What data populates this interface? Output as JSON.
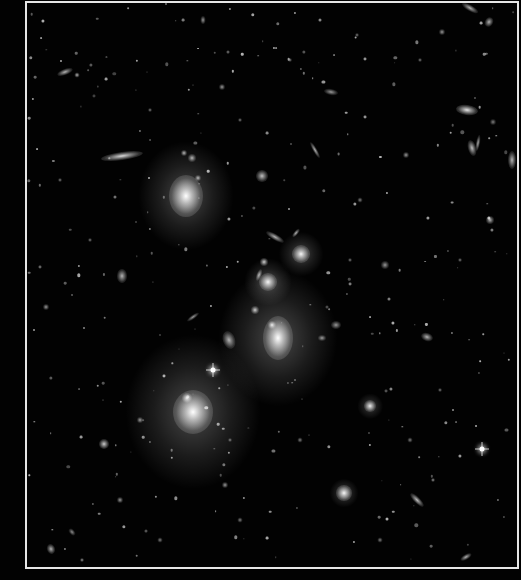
{
  "image": {
    "subject": "galaxy cluster deep field",
    "background_color": "#020202",
    "frame_color": "#e6e6e6"
  },
  "galaxies": [
    {
      "x": 186,
      "y": 196,
      "w": 34,
      "h": 42,
      "r": 0,
      "b": 1.0,
      "halo": 60
    },
    {
      "x": 193,
      "y": 412,
      "w": 40,
      "h": 44,
      "r": 0,
      "b": 1.0,
      "halo": 85
    },
    {
      "x": 187,
      "y": 398,
      "w": 10,
      "h": 10,
      "r": 0,
      "b": 0.9,
      "halo": 10
    },
    {
      "x": 278,
      "y": 338,
      "w": 30,
      "h": 44,
      "r": 0,
      "b": 1.0,
      "halo": 75
    },
    {
      "x": 272,
      "y": 325,
      "w": 8,
      "h": 8,
      "r": 0,
      "b": 0.9,
      "halo": 10
    },
    {
      "x": 268,
      "y": 282,
      "w": 18,
      "h": 18,
      "r": 0,
      "b": 0.95,
      "halo": 30
    },
    {
      "x": 301,
      "y": 254,
      "w": 18,
      "h": 18,
      "r": 0,
      "b": 0.95,
      "halo": 28
    },
    {
      "x": 264,
      "y": 262,
      "w": 8,
      "h": 8,
      "r": 0,
      "b": 0.8,
      "halo": 10
    },
    {
      "x": 255,
      "y": 310,
      "w": 8,
      "h": 8,
      "r": 0,
      "b": 0.8,
      "halo": 12
    },
    {
      "x": 275,
      "y": 237,
      "w": 6,
      "h": 20,
      "r": -60,
      "b": 0.7,
      "halo": 8
    },
    {
      "x": 296,
      "y": 233,
      "w": 4,
      "h": 10,
      "r": 40,
      "b": 0.7,
      "halo": 5
    },
    {
      "x": 259,
      "y": 275,
      "w": 5,
      "h": 12,
      "r": 20,
      "b": 0.7,
      "halo": 6
    },
    {
      "x": 229,
      "y": 340,
      "w": 12,
      "h": 18,
      "r": -20,
      "b": 0.7,
      "halo": 10
    },
    {
      "x": 122,
      "y": 156,
      "w": 42,
      "h": 8,
      "r": -8,
      "b": 0.85,
      "halo": 10
    },
    {
      "x": 184,
      "y": 153,
      "w": 6,
      "h": 6,
      "r": 0,
      "b": 0.7,
      "halo": 6
    },
    {
      "x": 192,
      "y": 158,
      "w": 8,
      "h": 8,
      "r": 0,
      "b": 0.7,
      "halo": 8
    },
    {
      "x": 198,
      "y": 178,
      "w": 6,
      "h": 6,
      "r": 0,
      "b": 0.7,
      "halo": 6
    },
    {
      "x": 262,
      "y": 176,
      "w": 12,
      "h": 12,
      "r": 0,
      "b": 0.75,
      "halo": 12
    },
    {
      "x": 315,
      "y": 150,
      "w": 4,
      "h": 18,
      "r": -30,
      "b": 0.7,
      "halo": 5
    },
    {
      "x": 467,
      "y": 110,
      "w": 22,
      "h": 10,
      "r": 8,
      "b": 0.9,
      "halo": 12
    },
    {
      "x": 472,
      "y": 148,
      "w": 8,
      "h": 16,
      "r": -15,
      "b": 0.75,
      "halo": 8
    },
    {
      "x": 478,
      "y": 143,
      "w": 4,
      "h": 16,
      "r": 10,
      "b": 0.65,
      "halo": 5
    },
    {
      "x": 470,
      "y": 8,
      "w": 18,
      "h": 6,
      "r": 30,
      "b": 0.7,
      "halo": 6
    },
    {
      "x": 489,
      "y": 22,
      "w": 8,
      "h": 10,
      "r": 30,
      "b": 0.7,
      "halo": 8
    },
    {
      "x": 442,
      "y": 32,
      "w": 6,
      "h": 6,
      "r": 0,
      "b": 0.6,
      "halo": 6
    },
    {
      "x": 493,
      "y": 122,
      "w": 6,
      "h": 6,
      "r": 0,
      "b": 0.5,
      "halo": 5
    },
    {
      "x": 512,
      "y": 160,
      "w": 8,
      "h": 18,
      "r": 0,
      "b": 0.7,
      "halo": 8
    },
    {
      "x": 490,
      "y": 220,
      "w": 8,
      "h": 8,
      "r": 0,
      "b": 0.7,
      "halo": 8
    },
    {
      "x": 370,
      "y": 406,
      "w": 12,
      "h": 12,
      "r": 0,
      "b": 0.9,
      "halo": 16
    },
    {
      "x": 344,
      "y": 493,
      "w": 16,
      "h": 16,
      "r": 0,
      "b": 0.95,
      "halo": 18
    },
    {
      "x": 417,
      "y": 500,
      "w": 6,
      "h": 18,
      "r": -45,
      "b": 0.75,
      "halo": 6
    },
    {
      "x": 427,
      "y": 337,
      "w": 12,
      "h": 8,
      "r": 20,
      "b": 0.7,
      "halo": 8
    },
    {
      "x": 466,
      "y": 557,
      "w": 12,
      "h": 5,
      "r": -30,
      "b": 0.7,
      "halo": 6
    },
    {
      "x": 433,
      "y": 480,
      "w": 4,
      "h": 4,
      "r": 0,
      "b": 0.6,
      "halo": 4
    },
    {
      "x": 104,
      "y": 444,
      "w": 10,
      "h": 10,
      "r": 0,
      "b": 0.8,
      "halo": 10
    },
    {
      "x": 51,
      "y": 549,
      "w": 8,
      "h": 10,
      "r": -20,
      "b": 0.7,
      "halo": 8
    },
    {
      "x": 72,
      "y": 532,
      "w": 5,
      "h": 8,
      "r": -40,
      "b": 0.55,
      "halo": 5
    },
    {
      "x": 82,
      "y": 560,
      "w": 4,
      "h": 4,
      "r": 0,
      "b": 0.6,
      "halo": 4
    },
    {
      "x": 122,
      "y": 276,
      "w": 10,
      "h": 14,
      "r": 0,
      "b": 0.7,
      "halo": 10
    },
    {
      "x": 65,
      "y": 72,
      "w": 16,
      "h": 6,
      "r": -20,
      "b": 0.7,
      "halo": 6
    },
    {
      "x": 77,
      "y": 75,
      "w": 5,
      "h": 5,
      "r": 0,
      "b": 0.7,
      "halo": 5
    },
    {
      "x": 203,
      "y": 20,
      "w": 5,
      "h": 8,
      "r": 0,
      "b": 0.6,
      "halo": 6
    },
    {
      "x": 222,
      "y": 87,
      "w": 6,
      "h": 6,
      "r": 0,
      "b": 0.6,
      "halo": 6
    },
    {
      "x": 331,
      "y": 92,
      "w": 14,
      "h": 6,
      "r": 10,
      "b": 0.6,
      "halo": 6
    },
    {
      "x": 357,
      "y": 35,
      "w": 4,
      "h": 4,
      "r": 0,
      "b": 0.5,
      "halo": 4
    },
    {
      "x": 406,
      "y": 155,
      "w": 6,
      "h": 6,
      "r": 0,
      "b": 0.6,
      "halo": 6
    },
    {
      "x": 385,
      "y": 265,
      "w": 8,
      "h": 8,
      "r": 0,
      "b": 0.6,
      "halo": 8
    },
    {
      "x": 336,
      "y": 325,
      "w": 10,
      "h": 8,
      "r": 0,
      "b": 0.6,
      "halo": 8
    },
    {
      "x": 322,
      "y": 338,
      "w": 8,
      "h": 6,
      "r": 0,
      "b": 0.6,
      "halo": 6
    },
    {
      "x": 193,
      "y": 317,
      "w": 14,
      "h": 4,
      "r": -35,
      "b": 0.6,
      "halo": 5
    },
    {
      "x": 46,
      "y": 307,
      "w": 6,
      "h": 6,
      "r": 0,
      "b": 0.6,
      "halo": 6
    },
    {
      "x": 140,
      "y": 420,
      "w": 6,
      "h": 6,
      "r": 0,
      "b": 0.6,
      "halo": 6
    },
    {
      "x": 225,
      "y": 485,
      "w": 6,
      "h": 6,
      "r": 0,
      "b": 0.6,
      "halo": 6
    },
    {
      "x": 120,
      "y": 500,
      "w": 6,
      "h": 6,
      "r": 0,
      "b": 0.6,
      "halo": 6
    },
    {
      "x": 240,
      "y": 520,
      "w": 5,
      "h": 5,
      "r": 0,
      "b": 0.5,
      "halo": 5
    },
    {
      "x": 380,
      "y": 540,
      "w": 5,
      "h": 5,
      "r": 0,
      "b": 0.5,
      "halo": 5
    },
    {
      "x": 160,
      "y": 540,
      "w": 5,
      "h": 5,
      "r": 0,
      "b": 0.5,
      "halo": 5
    },
    {
      "x": 300,
      "y": 440,
      "w": 5,
      "h": 5,
      "r": 0,
      "b": 0.5,
      "halo": 5
    },
    {
      "x": 410,
      "y": 440,
      "w": 5,
      "h": 5,
      "r": 0,
      "b": 0.5,
      "halo": 5
    },
    {
      "x": 440,
      "y": 390,
      "w": 4,
      "h": 4,
      "r": 0,
      "b": 0.5,
      "halo": 4
    },
    {
      "x": 360,
      "y": 200,
      "w": 5,
      "h": 5,
      "r": 0,
      "b": 0.5,
      "halo": 5
    },
    {
      "x": 240,
      "y": 120,
      "w": 4,
      "h": 4,
      "r": 0,
      "b": 0.5,
      "halo": 4
    },
    {
      "x": 150,
      "y": 110,
      "w": 4,
      "h": 4,
      "r": 0,
      "b": 0.5,
      "halo": 4
    },
    {
      "x": 90,
      "y": 240,
      "w": 4,
      "h": 4,
      "r": 0,
      "b": 0.5,
      "halo": 4
    },
    {
      "x": 60,
      "y": 180,
      "w": 4,
      "h": 4,
      "r": 0,
      "b": 0.5,
      "halo": 4
    },
    {
      "x": 420,
      "y": 60,
      "w": 4,
      "h": 4,
      "r": 0,
      "b": 0.5,
      "halo": 4
    },
    {
      "x": 290,
      "y": 60,
      "w": 4,
      "h": 4,
      "r": 0,
      "b": 0.5,
      "halo": 4
    },
    {
      "x": 460,
      "y": 260,
      "w": 4,
      "h": 4,
      "r": 0,
      "b": 0.5,
      "halo": 4
    },
    {
      "x": 350,
      "y": 260,
      "w": 4,
      "h": 4,
      "r": 0,
      "b": 0.5,
      "halo": 4
    },
    {
      "x": 230,
      "y": 440,
      "w": 4,
      "h": 4,
      "r": 0,
      "b": 0.5,
      "halo": 4
    }
  ],
  "stars": [
    {
      "x": 213,
      "y": 370
    },
    {
      "x": 482,
      "y": 449
    }
  ]
}
